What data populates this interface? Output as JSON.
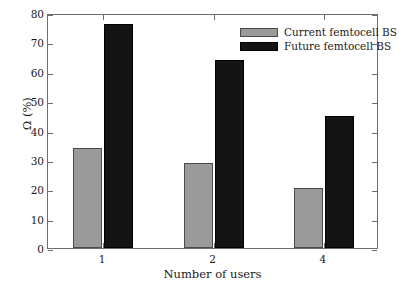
{
  "chart_data": {
    "type": "bar",
    "title": "",
    "xlabel": "Number of users",
    "ylabel": "Ω (%)",
    "categories": [
      "1",
      "2",
      "4"
    ],
    "series": [
      {
        "name": "Current femtocell BS",
        "color": "#9a9a9a",
        "values": [
          34,
          29,
          20.3
        ]
      },
      {
        "name": "Future femtocell BS",
        "color": "#141414",
        "values": [
          76.3,
          64,
          44.8
        ]
      }
    ],
    "ylim": [
      0,
      80
    ],
    "yticks": [
      0,
      10,
      20,
      30,
      40,
      50,
      60,
      70,
      80
    ],
    "ytick_labels": [
      "0",
      "10",
      "20",
      "30",
      "40",
      "50",
      "60",
      "70",
      "80"
    ],
    "xtick_labels": [
      "1",
      "2",
      "4"
    ],
    "grid": false,
    "legend_position": "top-right",
    "legend_entries": [
      "Current femtocell BS",
      "Future femtocell BS"
    ]
  },
  "axes": {
    "y_title": "Ω (%)",
    "x_title": "Number of users"
  },
  "legend": {
    "items": [
      {
        "label": "Current femtocell BS"
      },
      {
        "label": "Future femtocell BS"
      }
    ]
  }
}
